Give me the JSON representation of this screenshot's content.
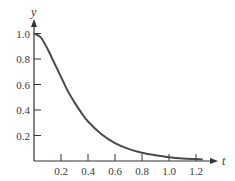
{
  "chart_data": {
    "type": "line",
    "title": "",
    "xlabel": "t",
    "ylabel": "y",
    "xlim": [
      0,
      1.3
    ],
    "ylim": [
      0,
      1.05
    ],
    "grid": false,
    "legend": null,
    "x_ticks": [
      "0.2",
      "0.4",
      "0.6",
      "0.8",
      "1.0",
      "1.2"
    ],
    "y_ticks": [
      "0.2",
      "0.4",
      "0.6",
      "0.8",
      "1.0"
    ],
    "series": [
      {
        "name": "y(t)",
        "color": "#4a4a4a",
        "x": [
          0,
          0.05,
          0.1,
          0.15,
          0.2,
          0.25,
          0.3,
          0.35,
          0.4,
          0.5,
          0.6,
          0.7,
          0.8,
          0.9,
          1.0,
          1.1,
          1.2,
          1.25
        ],
        "values": [
          1.0,
          0.97,
          0.88,
          0.77,
          0.66,
          0.55,
          0.46,
          0.38,
          0.31,
          0.21,
          0.14,
          0.095,
          0.065,
          0.045,
          0.03,
          0.02,
          0.015,
          0.012
        ]
      }
    ]
  }
}
